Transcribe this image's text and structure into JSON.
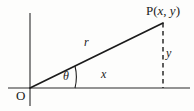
{
  "figure": {
    "type": "polar-coordinate-diagram",
    "background_color": "#fdfdfc",
    "ink_color": "#1b1b1b",
    "labels": {
      "point_prefix": "P(",
      "point_x": "x",
      "point_comma": ", ",
      "point_y": "y",
      "point_suffix": ")",
      "origin": "O",
      "radius": "r",
      "horizontal_leg": "x",
      "vertical_leg": "y",
      "angle": "θ"
    },
    "geometry": {
      "origin_px": [
        30,
        88
      ],
      "point_px": [
        163,
        23
      ],
      "x_axis": {
        "x1": 8,
        "y1": 88,
        "x2": 190,
        "y2": 88
      },
      "y_axis": {
        "x1": 30,
        "y1": 13,
        "x2": 30,
        "y2": 106
      },
      "hypotenuse": {
        "x1": 30,
        "y1": 88,
        "x2": 163,
        "y2": 23
      },
      "dashed_vertical": {
        "x1": 163,
        "y1": 23,
        "x2": 163,
        "y2": 88
      },
      "angle_arc_radius": 45,
      "angle_arc_tick": {
        "x1": 75,
        "y1": 66,
        "x2": 75,
        "y2": 88
      }
    }
  }
}
